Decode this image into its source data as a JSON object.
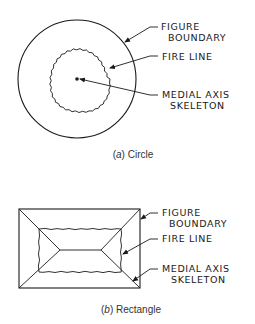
{
  "panels": [
    {
      "id": "a",
      "shape": "circle",
      "caption_letter": "a",
      "caption_text": " Circle",
      "labels": {
        "figure_boundary_1": "FIGURE",
        "figure_boundary_2": "BOUNDARY",
        "fire_line": "FIRE LINE",
        "medial_axis_1": "MEDIAL AXIS",
        "medial_axis_2": "SKELETON"
      }
    },
    {
      "id": "b",
      "shape": "rectangle",
      "caption_letter": "b",
      "caption_text": " Rectangle",
      "labels": {
        "figure_boundary_1": "FIGURE",
        "figure_boundary_2": "BOUNDARY",
        "fire_line": "FIRE LINE",
        "medial_axis_1": "MEDIAL AXIS",
        "medial_axis_2": "SKELETON"
      }
    }
  ],
  "colors": {
    "stroke": "#1a1a1a",
    "background": "#ffffff"
  }
}
